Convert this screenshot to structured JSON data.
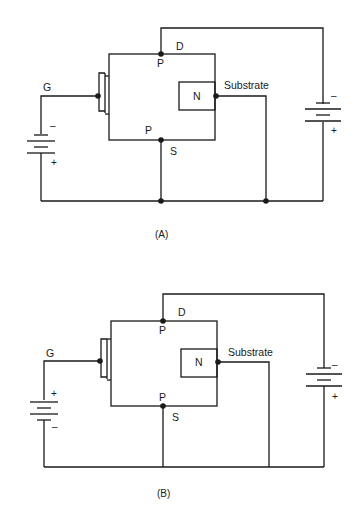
{
  "figures": [
    {
      "id": "A",
      "caption": "(A)",
      "labels": {
        "gate": "G",
        "drain": "D",
        "source": "S",
        "drain_region": "P",
        "source_region": "P",
        "substrate_region": "N",
        "substrate": "Substrate"
      },
      "gate_battery": {
        "top_sign": "–",
        "bottom_sign": "+"
      },
      "drain_battery": {
        "top_sign": "–",
        "bottom_sign": "+"
      },
      "substrate_connected_to_source": true
    },
    {
      "id": "B",
      "caption": "(B)",
      "labels": {
        "gate": "G",
        "drain": "D",
        "source": "S",
        "drain_region": "P",
        "source_region": "P",
        "substrate_region": "N",
        "substrate": "Substrate"
      },
      "gate_battery": {
        "top_sign": "+",
        "bottom_sign": "–"
      },
      "drain_battery": {
        "top_sign": "–",
        "bottom_sign": "+"
      },
      "substrate_connected_to_source": false
    }
  ]
}
